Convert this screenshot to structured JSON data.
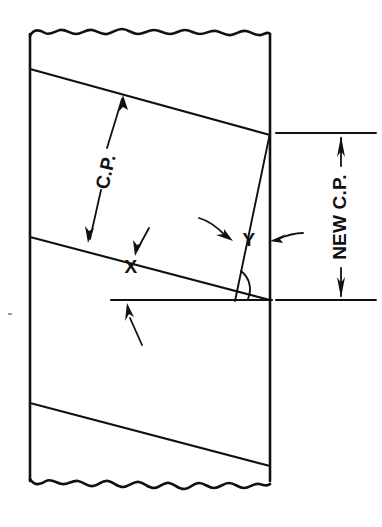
{
  "figure": {
    "kind": "technical-line-drawing",
    "background_color": "#ffffff",
    "ink_color": "#111111",
    "width": 382,
    "height": 527
  },
  "labels": {
    "cp": "C.P.",
    "new_cp": "NEW C.P.",
    "angle_x": "X",
    "angle_y": "Y"
  },
  "annotations": [
    {
      "name": "cp-dimension",
      "text": "C.P.",
      "orientation": "rotated",
      "rotation_deg": -75,
      "description": "Circular pitch measured perpendicular between two adjacent thread helix lines",
      "arrow_ends": "both",
      "from": [
        89,
        241
      ],
      "to": [
        123,
        97
      ]
    },
    {
      "name": "new-cp-dimension",
      "text": "NEW C.P.",
      "orientation": "rotated",
      "rotation_deg": -90,
      "description": "New circular pitch measured vertically at the right wall",
      "arrow_ends": "both",
      "from": [
        341,
        300
      ],
      "to": [
        341,
        133
      ]
    },
    {
      "name": "angle-x-label",
      "text": "X",
      "description": "Helix/lead angle between the thread line and the horizontal reference line",
      "position": [
        131,
        266
      ]
    },
    {
      "name": "angle-y-label",
      "text": "Y",
      "description": "Angle between the new diagonal line and the thread line at the right wall",
      "position": [
        246,
        239
      ]
    }
  ],
  "geometry": {
    "left_wall_x": 30,
    "right_wall_x": 270,
    "top_break_y": 33,
    "bottom_break_y": 478,
    "thread_lines": [
      {
        "name": "thread-line-upper",
        "from": [
          30,
          69
        ],
        "to": [
          270,
          135
        ]
      },
      {
        "name": "thread-line-middle",
        "from": [
          30,
          237
        ],
        "to": [
          270,
          300
        ]
      },
      {
        "name": "thread-line-lower",
        "from": [
          30,
          403
        ],
        "to": [
          270,
          466
        ]
      }
    ],
    "new_cp_line": {
      "name": "new-helix-line",
      "from": [
        270,
        133
      ],
      "to": [
        236,
        300
      ]
    },
    "horizontal_reference": {
      "name": "horizontal-reference-line",
      "from": [
        111,
        300
      ],
      "to": [
        272,
        300
      ]
    },
    "extension_lines": [
      {
        "name": "extension-line-top",
        "from": [
          274,
          133
        ],
        "to": [
          376,
          133
        ]
      },
      {
        "name": "extension-line-bottom",
        "from": [
          274,
          300
        ],
        "to": [
          376,
          300
        ]
      }
    ]
  }
}
